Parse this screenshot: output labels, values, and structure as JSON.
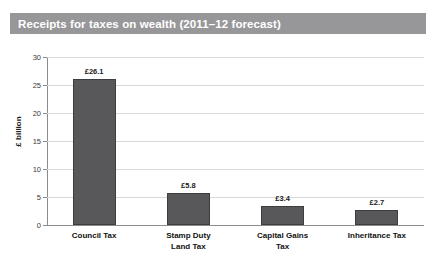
{
  "title": "Receipts for taxes on wealth (2011–12 forecast)",
  "colors": {
    "title_bar": "#97979a",
    "title_text": "#ffffff",
    "bar_fill": "#58585a",
    "bar_stroke": "#3d3d3f",
    "gridline": "#d9d9d9",
    "axis": "#8c8c8c",
    "background": "#ffffff"
  },
  "chart_data": {
    "type": "bar",
    "title": "Receipts for taxes on wealth (2011–12 forecast)",
    "categories": [
      "Council Tax",
      "Stamp Duty Land Tax",
      "Capital Gains Tax",
      "Inheritance Tax"
    ],
    "category_lines": [
      [
        "Council Tax"
      ],
      [
        "Stamp Duty",
        "Land Tax"
      ],
      [
        "Capital Gains",
        "Tax"
      ],
      [
        "Inheritance Tax"
      ]
    ],
    "values": [
      26.1,
      5.8,
      3.4,
      2.7
    ],
    "data_labels": [
      "£26.1",
      "£5.8",
      "£3.4",
      "£2.7"
    ],
    "xlabel": "",
    "ylabel": "£ billion",
    "ylim": [
      0,
      30
    ],
    "yticks": [
      0,
      5,
      10,
      15,
      20,
      25,
      30
    ],
    "ytick_labels": [
      "0",
      "5",
      "10",
      "15",
      "20",
      "25",
      "30"
    ],
    "grid": true,
    "legend": false
  }
}
